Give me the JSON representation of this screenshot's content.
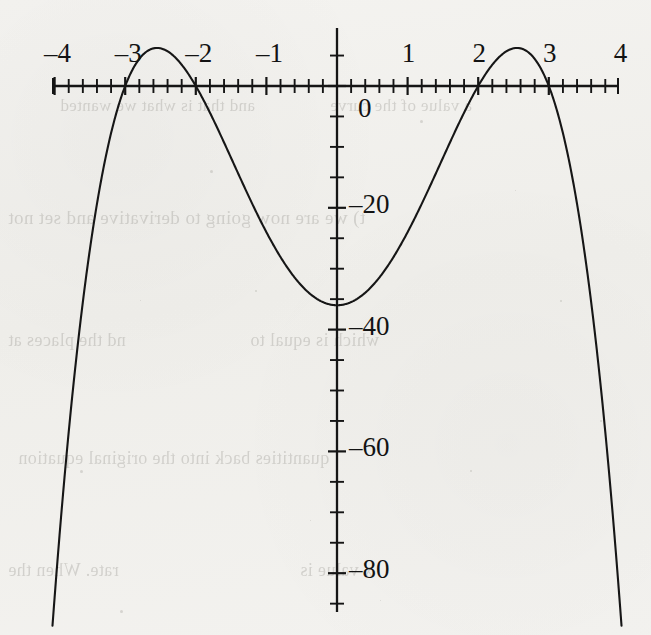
{
  "page": {
    "background_color": "#f2f1ee",
    "ink_color": "#151515"
  },
  "ghost_text": [
    {
      "text": "and that is what we wanted",
      "x": 60,
      "y": 96,
      "size": 17,
      "mirrored": true
    },
    {
      "text": "a value of the curve",
      "x": 330,
      "y": 96,
      "size": 17,
      "mirrored": true
    },
    {
      "text": "t) we are now going to derivative and set not",
      "x": 8,
      "y": 207,
      "size": 19,
      "mirrored": true
    },
    {
      "text": "nd the places at",
      "x": 8,
      "y": 330,
      "size": 18,
      "mirrored": true
    },
    {
      "text": "which is equal to",
      "x": 250,
      "y": 330,
      "size": 18,
      "mirrored": true
    },
    {
      "text": "quantities back into the original equation",
      "x": 18,
      "y": 448,
      "size": 18,
      "mirrored": true
    },
    {
      "text": "rate. When the",
      "x": 8,
      "y": 560,
      "size": 18,
      "mirrored": true
    },
    {
      "text": "x value is",
      "x": 300,
      "y": 560,
      "size": 18,
      "mirrored": true
    }
  ],
  "chart_data": {
    "type": "line",
    "title": "",
    "xlabel": "",
    "ylabel": "",
    "function": "y = -(x^2 - 4)(x^2 - 9) = -x^4 + 13x^2 - 36",
    "xlim": [
      -4.15,
      4.15
    ],
    "ylim": [
      -86,
      10
    ],
    "grid": false,
    "legend": null,
    "x_ticks_major": [
      -4,
      -3,
      -2,
      -1,
      0,
      1,
      2,
      3,
      4
    ],
    "x_tick_labels": [
      "–4",
      "–3",
      "–2",
      "–1",
      "",
      "1",
      "2",
      "3",
      "4"
    ],
    "x_tick_minor_step": 0.2,
    "y_ticks_major": [
      0,
      -20,
      -40,
      -60,
      -80
    ],
    "y_tick_labels": [
      "0",
      "–20",
      "–40",
      "–60",
      "–80"
    ],
    "y_tick_minor_step": 5,
    "roots": [
      -3,
      -2,
      2,
      3
    ],
    "local_maxima": [
      {
        "x": -2.5495,
        "y": 6.25
      },
      {
        "x": 2.5495,
        "y": 6.25
      }
    ],
    "local_minima": [
      {
        "x": 0,
        "y": -36
      }
    ],
    "x": [
      -4.0,
      -3.9,
      -3.8,
      -3.7,
      -3.6,
      -3.5,
      -3.4,
      -3.3,
      -3.2,
      -3.1,
      -3.0,
      -2.9,
      -2.8,
      -2.7,
      -2.6,
      -2.5,
      -2.4,
      -2.3,
      -2.2,
      -2.1,
      -2.0,
      -1.9,
      -1.8,
      -1.7,
      -1.6,
      -1.5,
      -1.4,
      -1.3,
      -1.2,
      -1.1,
      -1.0,
      -0.9,
      -0.8,
      -0.7,
      -0.6,
      -0.5,
      -0.4,
      -0.3,
      -0.2,
      -0.1,
      0.0,
      0.1,
      0.2,
      0.3,
      0.4,
      0.5,
      0.6,
      0.7,
      0.8,
      0.9,
      1.0,
      1.1,
      1.2,
      1.3,
      1.4,
      1.5,
      1.6,
      1.7,
      1.8,
      1.9,
      2.0,
      2.1,
      2.2,
      2.3,
      2.4,
      2.5,
      2.6,
      2.7,
      2.8,
      2.9,
      3.0,
      3.1,
      3.2,
      3.3,
      3.4,
      3.5,
      3.6,
      3.7,
      3.8,
      3.9,
      4.0
    ],
    "y": [
      -84.0,
      -73.9,
      -64.4,
      -55.5,
      -47.3,
      -39.8,
      -32.9,
      -26.6,
      -20.9,
      -15.8,
      -11.3,
      -7.3,
      -3.9,
      -1.0,
      1.5,
      3.5,
      5.1,
      6.3,
      7.2,
      7.8,
      8.0,
      8.0,
      7.7,
      7.2,
      6.6,
      5.8,
      4.8,
      3.8,
      2.7,
      1.5,
      0.4,
      -0.8,
      -1.9,
      -3.1,
      -4.2,
      -5.2,
      -6.2,
      -7.1,
      -7.9,
      -8.6,
      -9.2,
      -8.6,
      -7.9,
      -7.1,
      -6.2,
      -5.2,
      -4.2,
      -3.1,
      -1.9,
      -0.8,
      0.4,
      1.5,
      2.7,
      3.8,
      4.8,
      5.8,
      6.6,
      7.2,
      7.7,
      8.0,
      8.0,
      7.8,
      7.2,
      6.3,
      5.1,
      3.5,
      1.5,
      -1.0,
      -3.9,
      -7.3,
      -11.3,
      -15.8,
      -20.9,
      -26.6,
      -32.9,
      -39.8,
      -47.3,
      -55.5,
      -64.4,
      -73.9,
      -84.0
    ]
  },
  "axes_pixels": {
    "x_axis_y": 86,
    "y_axis_x": 337,
    "x_min_px": 53,
    "x_max_px": 618,
    "y_top_px": 28,
    "y_bottom_px": 612,
    "px_per_x_unit": 70.6,
    "px_per_y_unit": 6.09
  }
}
